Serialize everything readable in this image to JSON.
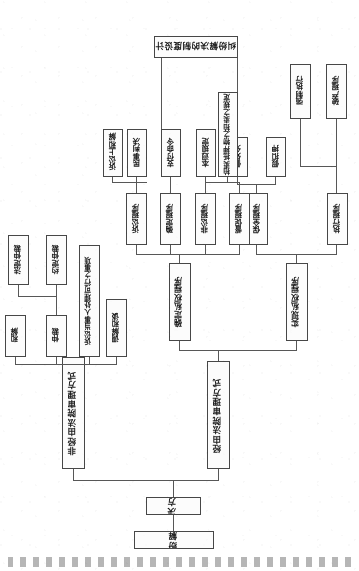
{
  "document": {
    "kind": "scanned-flowchart",
    "orientation_note": "page scanned upside-down (180 degrees)",
    "title": "民事纠纷解决方式",
    "page_header_smudge": "扫描页眉"
  },
  "nodes": {
    "root": "民事纠纷解决方式",
    "level1": "解决方式",
    "court_branch": "经由法院审理方式",
    "noncourt_branch": "非经由法院审理方式",
    "realize_right": "实现私权程序",
    "confirm_right": "确定私权程序",
    "execution": "执行程序",
    "preservation": "保全程序",
    "urge": "督促程序",
    "noncontentious": "非讼程序",
    "settle": "确定程序",
    "litigation": "诉讼程序",
    "bankruptcy": "破产程序",
    "compulsory_exec": "强制执行",
    "provisional_attach": "假扣押",
    "provisional_disp": "假处分",
    "auction_rule": "拍卖抵押物之拍卖之规定",
    "general_rule": "本迥规定",
    "payment_order": "支付命令",
    "civil_judgment": "民事判决",
    "court_settle": "诉讼上和解",
    "mediation": "调解和谈",
    "party_handle": "诉讼当事人处理可行之事项",
    "arbitration": "仲裁",
    "reconcile": "和解",
    "agreed_arb": "约定仲裁",
    "statutory_arb": "法定仲裁",
    "bottom_note": "纠纷解决的制度设计"
  },
  "edges": {
    "count": 26,
    "style": "orthogonal-elbow",
    "color": "#5a5a5a"
  },
  "colors": {
    "paper": "#ffffff",
    "box_border": "#4a4a4a",
    "box_fill": "#fdfdfd",
    "ink": "#1d1d1d",
    "line": "#5a5a5a"
  }
}
